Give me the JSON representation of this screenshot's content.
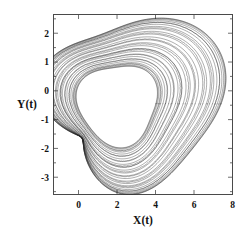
{
  "chart_data": {
    "type": "line",
    "title": "",
    "xlabel": "X(t)",
    "ylabel": "Y(t)",
    "xlim": [
      -1.3,
      8.0
    ],
    "ylim": [
      -3.6,
      2.65
    ],
    "xticks": [
      0,
      2,
      4,
      6,
      8
    ],
    "xticklabels": [
      "0",
      "2",
      "4",
      "6",
      "8"
    ],
    "yticks": [
      2,
      1,
      0,
      -1,
      -2,
      -3
    ],
    "yticklabels": [
      "2",
      "1",
      "0",
      "-1",
      "-2",
      "-3"
    ],
    "grid": false,
    "legend": null,
    "frame": "box",
    "tick_direction": "in",
    "minor_ticks": true,
    "line_color": "#2b2b2b",
    "series": [
      {
        "name": "phase-space trajectory",
        "description": "chaotic attractor orbit, nested loops spiralling outward from an inner limit cycle to large outer excursions",
        "loops": 26,
        "center": [
          2.05,
          -0.45
        ],
        "inner_extent": {
          "x": [
            -1.05,
            3.05
          ],
          "y": [
            -1.65,
            1.15
          ]
        },
        "outer_extent": {
          "x": [
            -1.15,
            7.65
          ],
          "y": [
            -3.35,
            2.45
          ]
        },
        "pinch_point": [
          0.55,
          -1.45
        ],
        "points_per_loop": 360
      }
    ]
  },
  "axes": {
    "xlabel": "X(t)",
    "ylabel": "Y(t)"
  }
}
